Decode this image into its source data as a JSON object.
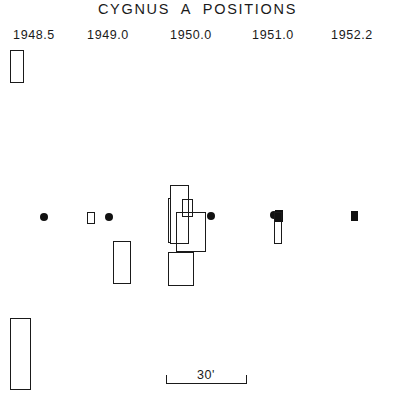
{
  "figure": {
    "title": "CYGNUS  A  POSITIONS",
    "width": 395,
    "height": 407,
    "background": "#ffffff",
    "ink_color": "#1a1a1a"
  },
  "epoch_labels": [
    {
      "text": "1948.5",
      "x": 4,
      "y": 28,
      "width": 60
    },
    {
      "text": "1949.0",
      "x": 78,
      "y": 28,
      "width": 60
    },
    {
      "text": "1950.0",
      "x": 161,
      "y": 28,
      "width": 60
    },
    {
      "text": "1951.0",
      "x": 243,
      "y": 28,
      "width": 60
    },
    {
      "text": "1952.2",
      "x": 322,
      "y": 28,
      "width": 60
    }
  ],
  "scale_bar": {
    "label": "30'",
    "label_x": 166,
    "label_y": 368,
    "label_width": 80,
    "line_x": 166,
    "line_y": 383,
    "line_length": 80,
    "tick_height": 9
  },
  "markers": [
    {
      "name": "error-box-1948-5-upper",
      "kind": "open",
      "x": 10,
      "y": 50,
      "w": 14,
      "h": 33
    },
    {
      "name": "error-box-1948-5-lower",
      "kind": "open",
      "x": 10,
      "y": 318,
      "w": 21,
      "h": 72
    },
    {
      "name": "position-dot-1948-5",
      "kind": "dot",
      "x": 40,
      "y": 213,
      "w": 8,
      "h": 8
    },
    {
      "name": "error-box-1949-0-small",
      "kind": "open",
      "x": 87,
      "y": 212,
      "w": 8,
      "h": 12
    },
    {
      "name": "position-dot-1949-0",
      "kind": "dot",
      "x": 105,
      "y": 213,
      "w": 8,
      "h": 8
    },
    {
      "name": "error-box-1949-0-lower",
      "kind": "open",
      "x": 113,
      "y": 241,
      "w": 18,
      "h": 43
    },
    {
      "name": "error-box-1950-0-narrow",
      "kind": "open",
      "x": 168,
      "y": 198,
      "w": 3,
      "h": 45
    },
    {
      "name": "error-box-1950-0-tall",
      "kind": "open",
      "x": 170,
      "y": 185,
      "w": 19,
      "h": 59
    },
    {
      "name": "error-box-1950-0-spike",
      "kind": "open",
      "x": 182,
      "y": 199,
      "w": 11,
      "h": 18
    },
    {
      "name": "error-box-1950-0-main",
      "kind": "open",
      "x": 176,
      "y": 212,
      "w": 30,
      "h": 40
    },
    {
      "name": "error-box-1950-0-lower",
      "kind": "open",
      "x": 168,
      "y": 252,
      "w": 26,
      "h": 34
    },
    {
      "name": "position-dot-1950-0",
      "kind": "dot",
      "x": 207,
      "y": 212,
      "w": 8,
      "h": 8
    },
    {
      "name": "position-dot-1951-0",
      "kind": "dot",
      "x": 270,
      "y": 211,
      "w": 8,
      "h": 8
    },
    {
      "name": "filled-box-1951-0",
      "kind": "filled",
      "x": 275,
      "y": 210,
      "w": 8,
      "h": 12
    },
    {
      "name": "error-box-1951-0-bar",
      "kind": "open",
      "x": 274,
      "y": 212,
      "w": 8,
      "h": 32
    },
    {
      "name": "filled-box-1952-2",
      "kind": "filled",
      "x": 351,
      "y": 211,
      "w": 7,
      "h": 10
    }
  ]
}
